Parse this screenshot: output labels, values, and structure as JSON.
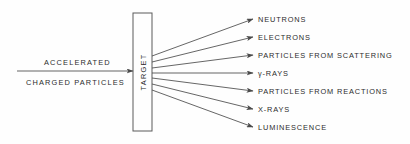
{
  "diagram": {
    "background_color": "#fefefe",
    "line_color": "#4a4a4a",
    "text_color": "#2c2c2c",
    "box": {
      "label": "TARGET",
      "orientation": "vertical-bottom-to-top",
      "x": 133,
      "y": 13,
      "width": 19,
      "height": 118
    },
    "input_beam": {
      "line_label": "ACCELERATED",
      "line_label_2": "CHARGED PARTICLES",
      "arrow_from_x": 17,
      "arrow_to_x": 133,
      "arrow_y": 71,
      "arrowhead": "arrowhead-right"
    },
    "outputs": [
      {
        "label": "NEUTRONS",
        "origin_y": 56,
        "tip_x": 253,
        "tip_y": 19,
        "text_x": 258,
        "text_y": 22
      },
      {
        "label": "ELECTRONS",
        "origin_y": 62,
        "tip_x": 253,
        "tip_y": 37,
        "text_x": 258,
        "text_y": 40
      },
      {
        "label": "PARTICLES FROM SCATTERING",
        "origin_y": 68,
        "tip_x": 253,
        "tip_y": 55,
        "text_x": 258,
        "text_y": 58
      },
      {
        "label": "γ-RAYS",
        "origin_y": 73,
        "tip_x": 253,
        "tip_y": 73,
        "text_x": 258,
        "text_y": 76
      },
      {
        "label": "PARTICLES FROM REACTIONS",
        "origin_y": 78,
        "tip_x": 253,
        "tip_y": 91,
        "text_x": 258,
        "text_y": 94
      },
      {
        "label": "X-RAYS",
        "origin_y": 84,
        "tip_x": 253,
        "tip_y": 109,
        "text_x": 258,
        "text_y": 112
      },
      {
        "label": "LUMINESCENCE",
        "origin_y": 90,
        "tip_x": 253,
        "tip_y": 127,
        "text_x": 258,
        "text_y": 130
      }
    ]
  }
}
